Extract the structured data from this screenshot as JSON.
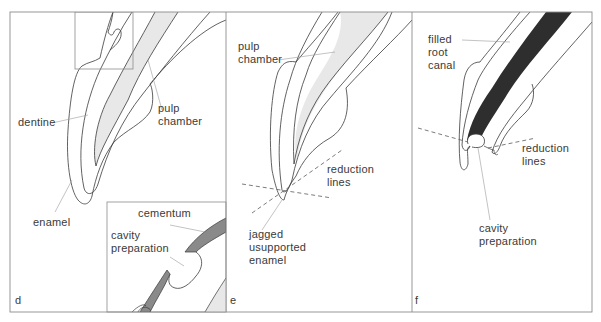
{
  "figure": {
    "panels": [
      {
        "id": "d",
        "letter": "d",
        "labels": {
          "dentine": "dentine",
          "pulp_chamber": "pulp\nchamber",
          "enamel": "enamel",
          "cementum": "cementum",
          "cavity_preparation": "cavity\npreparation"
        },
        "has_inset": true
      },
      {
        "id": "e",
        "letter": "e",
        "labels": {
          "pulp_chamber": "pulp\nchamber",
          "reduction_lines": "reduction\nlines",
          "jagged_enamel": "jagged\nusupported\nenamel"
        }
      },
      {
        "id": "f",
        "letter": "f",
        "labels": {
          "filled_root_canal": "filled\nroot\ncanal",
          "reduction_lines": "reduction\nlines",
          "cavity_preparation": "cavity\npreparation"
        }
      }
    ],
    "colors": {
      "outline": "#3a3a3a",
      "pulp_fill": "#e6e6e6",
      "cementum_fill": "#8a8a8a",
      "root_filling": "#2e2e2e",
      "frame": "#8c8c8c",
      "leader": "#9a9a9a"
    }
  }
}
